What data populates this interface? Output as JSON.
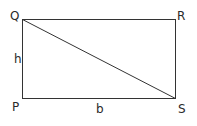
{
  "diagram": {
    "type": "rectangle-with-diagonal",
    "vertices": {
      "P": {
        "label": "P",
        "position": "bottom-left"
      },
      "Q": {
        "label": "Q",
        "position": "top-left"
      },
      "R": {
        "label": "R",
        "position": "top-right"
      },
      "S": {
        "label": "S",
        "position": "bottom-right"
      }
    },
    "side_labels": {
      "height": "h",
      "base": "b"
    },
    "diagonal": "QS",
    "stroke_color": "#333333"
  }
}
